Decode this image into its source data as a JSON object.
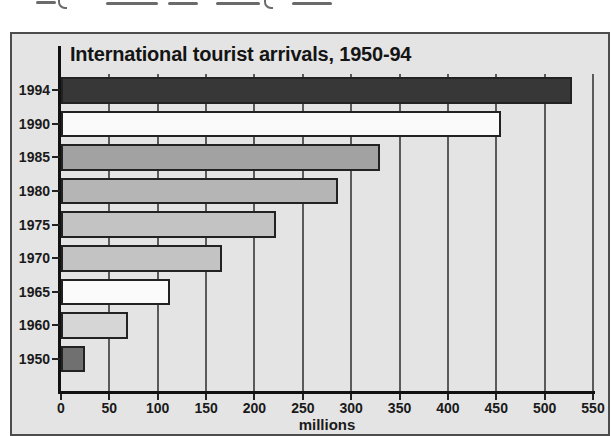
{
  "chart_data": {
    "type": "bar",
    "orientation": "horizontal",
    "title": "International tourist arrivals, 1950-94",
    "categories": [
      "1994",
      "1990",
      "1985",
      "1980",
      "1975",
      "1970",
      "1965",
      "1960",
      "1950"
    ],
    "values": [
      528,
      455,
      330,
      286,
      222,
      166,
      113,
      69,
      25
    ],
    "bar_colors": [
      "#373737",
      "#fafafa",
      "#a2a2a2",
      "#b5b5b5",
      "#c3c3c3",
      "#c3c3c3",
      "#fbfbfb",
      "#d6d6d6",
      "#707070"
    ],
    "bar_border_color": "#222222",
    "xlabel": "millions",
    "xlim": [
      0,
      550
    ],
    "xticks": [
      0,
      50,
      100,
      150,
      200,
      250,
      300,
      350,
      400,
      450,
      500,
      550
    ],
    "grid": true,
    "legend": "none",
    "panel_bg": "#e4e4e4",
    "axis_color": "#111111"
  }
}
